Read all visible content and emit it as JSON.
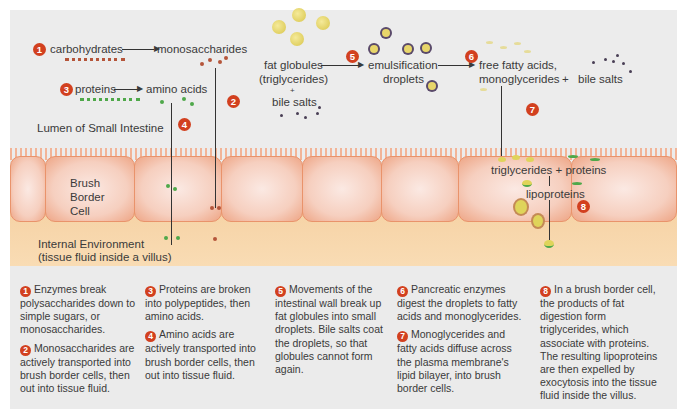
{
  "diagram": {
    "labels": {
      "carbohydrates": "carbohydrates",
      "monosaccharides": "monosaccharides",
      "proteins": "proteins",
      "amino_acids": "amino acids",
      "lumen": "Lumen of Small Intestine",
      "brush_border_cell_1": "Brush",
      "brush_border_cell_2": "Border",
      "brush_border_cell_3": "Cell",
      "internal_env_1": "Internal Environment",
      "internal_env_2": "(tissue fluid inside a villus)",
      "fat_globules_1": "fat globules",
      "fat_globules_2": "(triglycerides)",
      "plus": "+",
      "bile_salts_1": "bile salts",
      "emulsification_1": "emulsification",
      "emulsification_2": "droplets",
      "ffa_1": "free fatty acids,",
      "ffa_2": "monoglycerides",
      "plus2": "+",
      "bile_salts_2": "bile salts",
      "triglycerides_proteins": "triglycerides + proteins",
      "lipoproteins": "lipoproteins"
    },
    "badges": [
      "1",
      "2",
      "3",
      "4",
      "5",
      "6",
      "7",
      "8"
    ],
    "colors": {
      "badge": "#d2401f",
      "carbohydrate_dots": "#b5553a",
      "amino_acid_dots": "#4fa84a",
      "fat_globule": "#e8d66a",
      "bile_salt": "#4a3f55",
      "cell": "#f6cfbf",
      "tissue_fluid": "#f6d3a6"
    }
  },
  "captions": [
    {
      "num": "1",
      "text": "Enzymes break polysaccharides down to simple sugars, or monosaccharides."
    },
    {
      "num": "2",
      "text": "Monosaccharides are actively transported into brush border cells, then out into tissue fluid."
    },
    {
      "num": "3",
      "text": "Proteins are broken into polypeptides, then amino acids."
    },
    {
      "num": "4",
      "text": "Amino acids are actively transported into brush border cells, then out into tissue fluid."
    },
    {
      "num": "5",
      "text": "Movements of the intestinal wall break up fat globules into small droplets. Bile salts coat the droplets, so that globules cannot form again."
    },
    {
      "num": "6",
      "text": "Pancreatic enzymes digest the droplets to fatty acids and monoglycerides."
    },
    {
      "num": "7",
      "text": "Monoglycerides and fatty acids diffuse across the plasma membrane's lipid bilayer, into brush border cells."
    },
    {
      "num": "8",
      "text": "In a brush border cell, the products of fat digestion form triglycerides, which associate with proteins. The resulting lipoproteins are then expelled by exocytosis into the tissue fluid inside the villus."
    }
  ]
}
